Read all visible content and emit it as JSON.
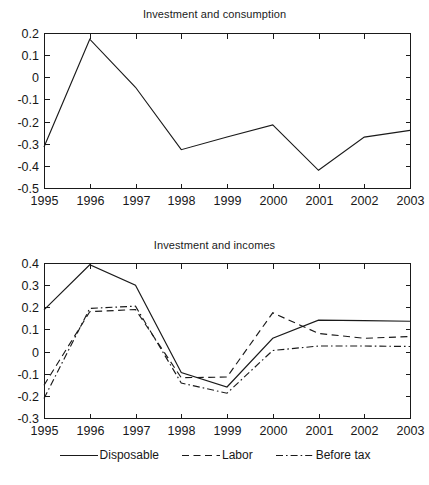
{
  "figure": {
    "background": "#ffffff",
    "line_color": "#1a1a1a",
    "text_color": "#171717"
  },
  "panels": {
    "top": {
      "title": "Investment and consumption",
      "ylabels": [
        "0.2",
        "0.1",
        "0",
        "-0.1",
        "-0.2",
        "-0.3",
        "-0.4",
        "-0.5"
      ],
      "xlabels": [
        "1995",
        "1996",
        "1997",
        "1998",
        "1999",
        "2000",
        "2001",
        "2002",
        "2003"
      ]
    },
    "bottom": {
      "title": "Investment and incomes",
      "ylabels": [
        "0.4",
        "0.3",
        "0.2",
        "0.1",
        "0",
        "-0.1",
        "-0.2",
        "-0.3"
      ],
      "xlabels": [
        "1995",
        "1996",
        "1997",
        "1998",
        "1999",
        "2000",
        "2001",
        "2002",
        "2003"
      ]
    }
  },
  "legend": {
    "items": [
      {
        "label": "Disposable",
        "style": "solid"
      },
      {
        "label": "Labor",
        "style": "dashed"
      },
      {
        "label": "Before tax",
        "style": "dashdot"
      }
    ]
  },
  "chart_data": [
    {
      "type": "line",
      "title": "Investment and consumption",
      "xlabel": "",
      "ylabel": "",
      "x": [
        1995,
        1996,
        1997,
        1998,
        1999,
        2000,
        2001,
        2002,
        2003
      ],
      "categories": [
        "1995",
        "1996",
        "1997",
        "1998",
        "1999",
        "2000",
        "2001",
        "2002",
        "2003"
      ],
      "values": [
        -0.315,
        0.172,
        -0.045,
        -0.327,
        -0.27,
        -0.215,
        -0.42,
        -0.27,
        -0.24
      ],
      "series": [
        {
          "name": "Investment and consumption",
          "style": "solid",
          "values": [
            -0.315,
            0.172,
            -0.045,
            -0.327,
            -0.27,
            -0.215,
            -0.42,
            -0.27,
            -0.24
          ]
        }
      ],
      "xlim": [
        1995,
        2003
      ],
      "ylim": [
        -0.5,
        0.2
      ],
      "yticks": [
        0.2,
        0.1,
        0,
        -0.1,
        -0.2,
        -0.3,
        -0.4,
        -0.5
      ],
      "xticks": [
        1995,
        1996,
        1997,
        1998,
        1999,
        2000,
        2001,
        2002,
        2003
      ],
      "grid": false,
      "legend": "none"
    },
    {
      "type": "line",
      "title": "Investment and incomes",
      "xlabel": "",
      "ylabel": "",
      "x": [
        1995,
        1996,
        1997,
        1998,
        1999,
        2000,
        2001,
        2002,
        2003
      ],
      "categories": [
        "1995",
        "1996",
        "1997",
        "1998",
        "1999",
        "2000",
        "2001",
        "2002",
        "2003"
      ],
      "series": [
        {
          "name": "Disposable",
          "style": "solid",
          "values": [
            0.188,
            0.392,
            0.3,
            -0.095,
            -0.16,
            0.06,
            0.142,
            0.14,
            0.137
          ]
        },
        {
          "name": "Labor",
          "style": "dashed",
          "values": [
            -0.152,
            0.18,
            0.19,
            -0.118,
            -0.115,
            0.175,
            0.082,
            0.06,
            0.068
          ]
        },
        {
          "name": "Before tax",
          "style": "dashdot",
          "values": [
            -0.212,
            0.195,
            0.205,
            -0.142,
            -0.188,
            0.005,
            0.025,
            0.025,
            0.023
          ]
        }
      ],
      "xlim": [
        1995,
        2003
      ],
      "ylim": [
        -0.3,
        0.4
      ],
      "yticks": [
        0.4,
        0.3,
        0.2,
        0.1,
        0,
        -0.1,
        -0.2,
        -0.3
      ],
      "xticks": [
        1995,
        1996,
        1997,
        1998,
        1999,
        2000,
        2001,
        2002,
        2003
      ],
      "grid": false,
      "legend": "below"
    }
  ]
}
